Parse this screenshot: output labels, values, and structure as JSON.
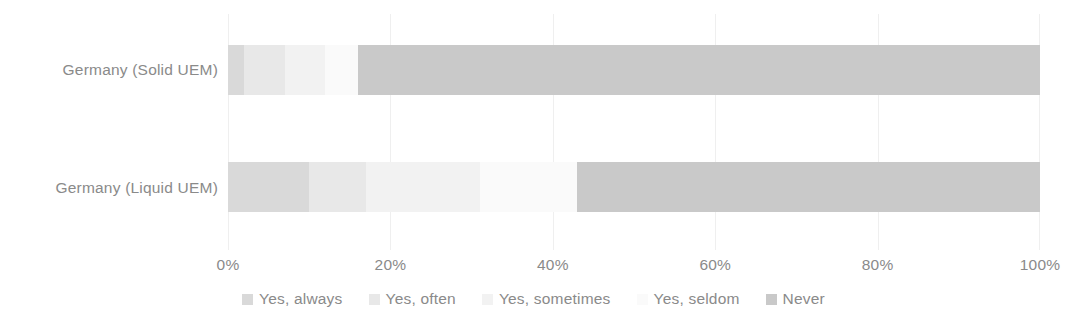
{
  "chart_data": {
    "type": "bar",
    "subtype": "stacked-horizontal-100pct",
    "title": "",
    "subtitle": "",
    "xlabel": "",
    "ylabel": "",
    "categories": [
      "Germany (Solid UEM)",
      "Germany (Liquid UEM)"
    ],
    "series": [
      {
        "name": "Yes, always",
        "values": [
          2,
          10
        ],
        "color": "#d9d9d9"
      },
      {
        "name": "Yes, often",
        "values": [
          5,
          7
        ],
        "color": "#e8e8e8"
      },
      {
        "name": "Yes, sometimes",
        "values": [
          5,
          14
        ],
        "color": "#f2f2f2"
      },
      {
        "name": "Yes, seldom",
        "values": [
          4,
          12
        ],
        "color": "#fafafa"
      },
      {
        "name": "Never",
        "values": [
          84,
          57
        ],
        "color": "#c9c9c9"
      }
    ],
    "xlim": [
      0,
      100
    ],
    "xticks": [
      0,
      20,
      40,
      60,
      80,
      100
    ],
    "xtick_labels": [
      "0%",
      "20%",
      "40%",
      "60%",
      "80%",
      "100%"
    ],
    "grid": true,
    "grid_orientation": "vertical",
    "legend_position": "bottom",
    "axis_text_color": "#8a8a8a",
    "gridline_color": "#efefef",
    "background_color": "#ffffff"
  },
  "axis": {
    "category_labels": [
      "Germany (Solid UEM)",
      "Germany (Liquid UEM)"
    ],
    "value_ticks": [
      "0%",
      "20%",
      "40%",
      "60%",
      "80%",
      "100%"
    ]
  },
  "legend": {
    "items": [
      {
        "label": "Yes, always"
      },
      {
        "label": "Yes, often"
      },
      {
        "label": "Yes, sometimes"
      },
      {
        "label": "Yes, seldom"
      },
      {
        "label": "Never"
      }
    ]
  }
}
